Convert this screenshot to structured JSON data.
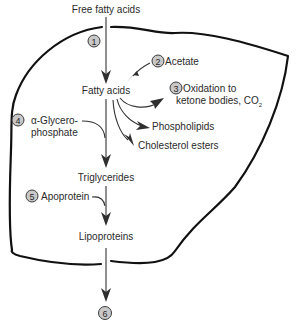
{
  "diagram": {
    "inputs": {
      "free_fatty_acids": "Free fatty acids"
    },
    "nodes": {
      "fatty_acids": "Fatty acids",
      "acetate": "Acetate",
      "oxidation_line1": "Oxidation to",
      "oxidation_line2": "ketone bodies, CO",
      "oxidation_subscript": "2",
      "phospholipids": "Phospholipids",
      "cholesterol_esters": "Cholesterol esters",
      "glycerophosphate_line1": "α-Glycero-",
      "glycerophosphate_line2": "phosphate",
      "triglycerides": "Triglycerides",
      "apoprotein": "Apoprotein",
      "lipoproteins": "Lipoproteins"
    },
    "steps": [
      {
        "number": "1",
        "label": "Uptake of free fatty acids"
      },
      {
        "number": "2",
        "label": "Synthesis from acetate"
      },
      {
        "number": "3",
        "label": "Oxidation"
      },
      {
        "number": "4",
        "label": "Esterification with α-glycerophosphate"
      },
      {
        "number": "5",
        "label": "Apoprotein addition"
      },
      {
        "number": "6",
        "label": "Secretion"
      }
    ],
    "colors": {
      "outline": "#111111",
      "arrow": "#333333",
      "badge_fill": "#c8c8c8",
      "text": "#2a2a2a"
    }
  }
}
